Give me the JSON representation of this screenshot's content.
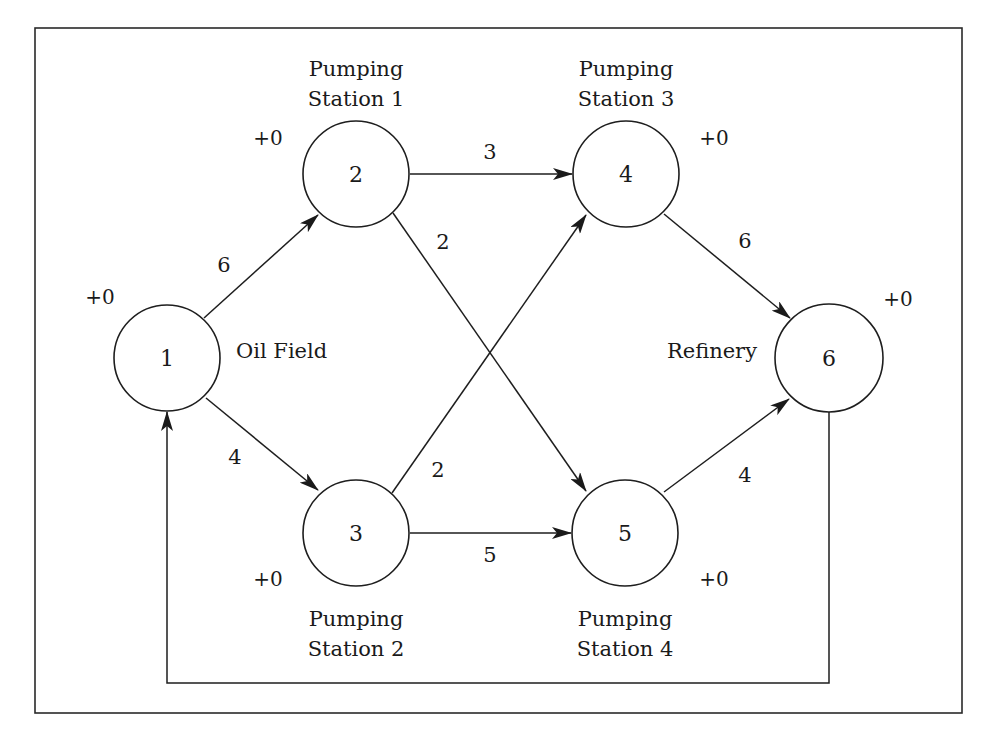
{
  "diagram": {
    "type": "directed-network-flow",
    "frame": true,
    "nodes": [
      {
        "id": "1",
        "label": "1",
        "name": "Oil Field",
        "name_lines": [
          "Oil Field"
        ],
        "capacity": "+0"
      },
      {
        "id": "2",
        "label": "2",
        "name": "Pumping Station 1",
        "name_lines": [
          "Pumping",
          "Station 1"
        ],
        "capacity": "+0"
      },
      {
        "id": "3",
        "label": "3",
        "name": "Pumping Station 2",
        "name_lines": [
          "Pumping",
          "Station 2"
        ],
        "capacity": "+0"
      },
      {
        "id": "4",
        "label": "4",
        "name": "Pumping Station 3",
        "name_lines": [
          "Pumping",
          "Station 3"
        ],
        "capacity": "+0"
      },
      {
        "id": "5",
        "label": "5",
        "name": "Pumping Station 4",
        "name_lines": [
          "Pumping",
          "Station 4"
        ],
        "capacity": "+0"
      },
      {
        "id": "6",
        "label": "6",
        "name": "Refinery",
        "name_lines": [
          "Refinery"
        ],
        "capacity": "+0"
      }
    ],
    "edges": [
      {
        "from": "1",
        "to": "2",
        "weight": "6"
      },
      {
        "from": "1",
        "to": "3",
        "weight": "4"
      },
      {
        "from": "2",
        "to": "4",
        "weight": "3"
      },
      {
        "from": "2",
        "to": "5",
        "weight": "2"
      },
      {
        "from": "3",
        "to": "4",
        "weight": "2"
      },
      {
        "from": "3",
        "to": "5",
        "weight": "5"
      },
      {
        "from": "4",
        "to": "6",
        "weight": "6"
      },
      {
        "from": "5",
        "to": "6",
        "weight": "4"
      },
      {
        "from": "6",
        "to": "1",
        "weight": "",
        "routing": "return-loop-below"
      }
    ]
  }
}
